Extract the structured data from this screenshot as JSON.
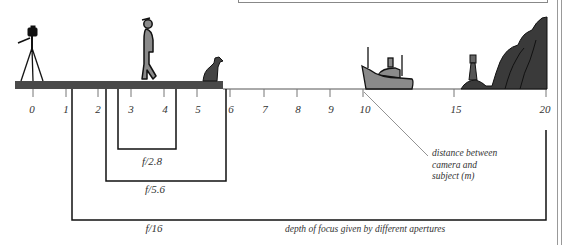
{
  "diagram": {
    "title": "depth of focus given by different apertures",
    "axis": {
      "label": "distance between camera and subject (m)",
      "label_lines": [
        "distance between",
        "camera and",
        "subject (m)"
      ],
      "ticks": [
        {
          "value": "0",
          "x": 33
        },
        {
          "value": "1",
          "x": 66
        },
        {
          "value": "2",
          "x": 98
        },
        {
          "value": "3",
          "x": 131
        },
        {
          "value": "4",
          "x": 164
        },
        {
          "value": "5",
          "x": 197
        },
        {
          "value": "6",
          "x": 230
        },
        {
          "value": "7",
          "x": 264
        },
        {
          "value": "8",
          "x": 297
        },
        {
          "value": "9",
          "x": 330
        },
        {
          "value": "10",
          "x": 363
        },
        {
          "value": "15",
          "x": 454
        },
        {
          "value": "20",
          "x": 546
        }
      ]
    },
    "apertures": [
      {
        "label": "f/2.8",
        "near_m": 2.6,
        "far_m": 4.4
      },
      {
        "label": "f/5.6",
        "near_m": 2.2,
        "far_m": 5.9
      },
      {
        "label": "f/16",
        "near_m": 1.2,
        "far_m": 20
      }
    ],
    "objects": [
      "camera-on-tripod",
      "person",
      "dog",
      "boat",
      "lighthouse",
      "cliffs"
    ],
    "colors": {
      "ground": "#4a4a4a",
      "figure_fill": "#8a8a8a",
      "dark_fill": "#3a3a3a",
      "line": "#111111",
      "tick": "#777777"
    }
  }
}
